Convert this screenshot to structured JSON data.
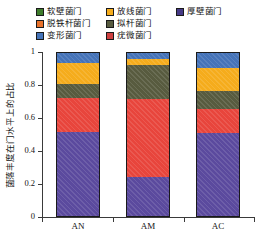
{
  "chart_data": {
    "type": "bar",
    "stacked": true,
    "normalized": true,
    "title": "",
    "xlabel": "",
    "ylabel": "菌落丰度在门水平上的占比",
    "ylim": [
      0,
      1
    ],
    "ytick_labels": [
      "0",
      "0.2",
      "0.4",
      "0.6",
      "0.8",
      "1"
    ],
    "ytick_values": [
      0,
      0.2,
      0.4,
      0.6,
      0.8,
      1
    ],
    "grid": false,
    "legend_position": "top",
    "categories": [
      "AN",
      "AM",
      "AC"
    ],
    "series": [
      {
        "name": "厚壁菌门",
        "color": "#5b4a9e",
        "values": [
          0.51,
          0.235,
          0.505
        ]
      },
      {
        "name": "疣微菌门",
        "color": "#e8453c",
        "values": [
          0.212,
          0.48,
          0.15
        ]
      },
      {
        "name": "拟杆菌门",
        "color": "#585b3f",
        "values": [
          0.082,
          0.208,
          0.105
        ]
      },
      {
        "name": "放线菌门",
        "color": "#f5ac1c",
        "values": [
          0.131,
          0.032,
          0.14
        ]
      },
      {
        "name": "变形菌门",
        "color": "#4573b8",
        "values": [
          0.065,
          0.045,
          0.1
        ]
      },
      {
        "name": "脱铁杆菌门",
        "color": "#e8712a",
        "values": [
          0.0,
          0.0,
          0.0
        ]
      },
      {
        "name": "软壁菌门",
        "color": "#3f7c2c",
        "values": [
          0.0,
          0.0,
          0.0
        ]
      }
    ]
  },
  "legend": {
    "items": [
      {
        "label": "软壁菌门",
        "color": "#3f7c2c"
      },
      {
        "label": "放线菌门",
        "color": "#f5ac1c"
      },
      {
        "label": "厚壁菌门",
        "color": "#463a86"
      },
      {
        "label": "脱铁杆菌门",
        "color": "#e8712a"
      },
      {
        "label": "拟杆菌门",
        "color": "#585b3f"
      },
      {
        "label": "变形菌门",
        "color": "#4573b8"
      },
      {
        "label": "疣微菌门",
        "color": "#cf4040"
      }
    ]
  },
  "axes": {
    "y_label": "菌落丰度在门水平上的占比",
    "y_ticks": [
      "1",
      "0.8",
      "0.6",
      "0.4",
      "0.2",
      "0"
    ],
    "x_ticks": [
      "AN",
      "AM",
      "AC"
    ]
  }
}
